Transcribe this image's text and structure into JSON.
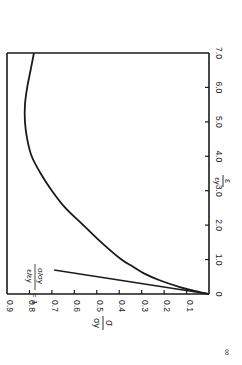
{
  "chart_data": {
    "type": "line",
    "title": "",
    "orientation": "rotated 90 degrees clockwise",
    "xlabel": "ε/εy",
    "ylabel": "σ/σy",
    "xlabel_num": "ε",
    "xlabel_den": "εy",
    "ylabel_num": "σ",
    "ylabel_den": "σy",
    "xlim": [
      0,
      7.0
    ],
    "ylim": [
      0,
      0.9
    ],
    "x_ticks": [
      "0",
      "1.0",
      "2.0",
      "3.0",
      "4.0",
      "5.0",
      "6.0",
      "7.0"
    ],
    "y_ticks": [
      "0.1",
      "0.2",
      "0.3",
      "0.4",
      "0.5",
      "0.6",
      "0.7",
      "0.8",
      "0.9"
    ],
    "grid": false,
    "series": [
      {
        "name": "stress-strain curve",
        "x": [
          0,
          0.1,
          0.2,
          0.4,
          0.6,
          0.8,
          1.0,
          1.5,
          2.0,
          2.5,
          3.0,
          3.5,
          4.0,
          4.5,
          5.0,
          5.5,
          6.0,
          6.5,
          7.0
        ],
        "y": [
          0,
          0.07,
          0.13,
          0.22,
          0.29,
          0.34,
          0.39,
          0.48,
          0.56,
          0.64,
          0.7,
          0.75,
          0.79,
          0.81,
          0.82,
          0.82,
          0.81,
          0.795,
          0.78
        ]
      },
      {
        "name": "elastic line",
        "x": [
          0,
          0.7
        ],
        "y": [
          0,
          0.69
        ]
      }
    ],
    "annotations": [
      {
        "text_num": "σ/σy",
        "text_den": "ε/εy",
        "text_rhs": "= 1",
        "label": "σ/σy / ε/εy = 1"
      }
    ],
    "footer_mark": "∞"
  }
}
